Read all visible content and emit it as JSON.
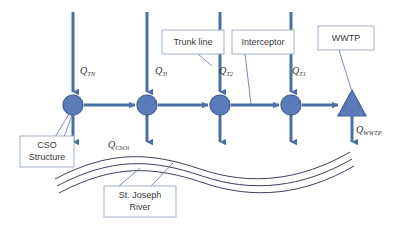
{
  "diagram": {
    "colors": {
      "pipe_blue": "#4a6fa5",
      "node_fill": "#5b7cb8",
      "node_stroke": "#3f5f94",
      "callout_stroke": "#9aa8c4",
      "river_stroke": "#3f3f5f",
      "leader_stroke": "#6b7fa8",
      "label_text": "#3a3a3a",
      "background": "#ffffff"
    },
    "callouts": [
      {
        "id": "trunk-line",
        "label": "Trunk line",
        "x": 162,
        "y": 30,
        "w": 62,
        "h": 24
      },
      {
        "id": "interceptor",
        "label": "Interceptor",
        "x": 232,
        "y": 30,
        "w": 62,
        "h": 24
      },
      {
        "id": "wwtp",
        "label": "WWTP",
        "x": 318,
        "y": 26,
        "w": 56,
        "h": 24
      },
      {
        "id": "cso-structure",
        "label": "CSO",
        "label2": "Structure",
        "x": 20,
        "y": 136,
        "w": 54,
        "h": 31
      },
      {
        "id": "st-joseph-river",
        "label": "St. Joseph",
        "label2": "River",
        "x": 104,
        "y": 186,
        "w": 72,
        "h": 31
      }
    ],
    "nodes": [
      {
        "id": "node-cso-1",
        "type": "circle",
        "cx": 73,
        "cy": 105,
        "r": 10
      },
      {
        "id": "node-cso-2",
        "type": "circle",
        "cx": 147,
        "cy": 105,
        "r": 10
      },
      {
        "id": "node-cso-3",
        "type": "circle",
        "cx": 220,
        "cy": 105,
        "r": 10
      },
      {
        "id": "node-cso-4",
        "type": "circle",
        "cx": 291,
        "cy": 105,
        "r": 10
      },
      {
        "id": "node-wwtp",
        "type": "triangle",
        "cx": 352,
        "cy": 105,
        "r": 13
      }
    ],
    "flow_labels": [
      {
        "id": "q-tn",
        "base": "Q",
        "sub": "TN",
        "x": 80,
        "y": 74
      },
      {
        "id": "q-ti",
        "base": "Q",
        "sub": "Ti",
        "x": 155,
        "y": 74
      },
      {
        "id": "q-t2",
        "base": "Q",
        "sub": "T2",
        "x": 219,
        "y": 74
      },
      {
        "id": "q-t1",
        "base": "Q",
        "sub": "T1",
        "x": 292,
        "y": 74
      },
      {
        "id": "q-csoi",
        "base": "Q",
        "sub": "CSOi",
        "x": 108,
        "y": 148
      },
      {
        "id": "q-wwtp",
        "base": "Q",
        "sub": "WWTP",
        "x": 356,
        "y": 133
      }
    ],
    "inflow_arrows": [
      {
        "id": "inflow-tn",
        "x": 73,
        "y1": 12,
        "y2": 92
      },
      {
        "id": "inflow-ti",
        "x": 147,
        "y1": 12,
        "y2": 92
      },
      {
        "id": "inflow-t2",
        "x": 220,
        "y1": 12,
        "y2": 92
      },
      {
        "id": "inflow-t1",
        "x": 291,
        "y1": 12,
        "y2": 92
      }
    ],
    "overflow_arrows": [
      {
        "id": "overflow-1",
        "x": 73,
        "y1": 112,
        "y2": 147
      },
      {
        "id": "overflow-2",
        "x": 147,
        "y1": 112,
        "y2": 147
      },
      {
        "id": "overflow-3",
        "x": 220,
        "y1": 112,
        "y2": 147
      },
      {
        "id": "overflow-4",
        "x": 291,
        "y1": 112,
        "y2": 147
      },
      {
        "id": "effluent-wwtp",
        "x": 352,
        "y1": 112,
        "y2": 147
      }
    ],
    "interceptor_segments": [
      {
        "id": "seg-1",
        "x1": 84,
        "x2": 135,
        "y": 105
      },
      {
        "id": "seg-2",
        "x1": 158,
        "x2": 208,
        "y": 105
      },
      {
        "id": "seg-3",
        "x1": 231,
        "x2": 279,
        "y": 105
      },
      {
        "id": "seg-4",
        "x1": 302,
        "x2": 338,
        "y": 105
      }
    ],
    "river_lines": [
      {
        "id": "river-line-1",
        "d": "M 55 179 C 110 150 150 152 200 169 C 250 186 300 181 350 152"
      },
      {
        "id": "river-line-2",
        "d": "M 57 186 C 112 157 152 159 202 176 C 252 193 302 188 352 159"
      },
      {
        "id": "river-line-3",
        "d": "M 59 193 C 114 164 154 166 204 183 C 254 200 304 195 354 166"
      }
    ],
    "leaders": [
      {
        "id": "leader-trunk-line",
        "d": "M 200 55 L 212 68"
      },
      {
        "id": "leader-interceptor",
        "d": "M 246 55 L 252 105"
      },
      {
        "id": "leader-wwtp",
        "d": "M 340 51 L 352 95"
      },
      {
        "id": "leader-cso-a",
        "d": "M 54 136 L 70 114"
      },
      {
        "id": "leader-cso-b",
        "d": "M 62 136 L 72 115"
      },
      {
        "id": "leader-river-a",
        "d": "M 118 186 L 140 168"
      },
      {
        "id": "leader-river-b",
        "d": "M 150 186 L 172 164"
      }
    ]
  }
}
